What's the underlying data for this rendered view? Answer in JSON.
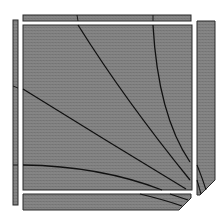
{
  "diagram": {
    "type": "geometric-illustration",
    "colors": {
      "fill": "#808080",
      "stroke": "#1a1a1a",
      "background": "#ffffff"
    },
    "panels": [
      {
        "name": "top-bar",
        "x": 23,
        "y": 15,
        "w": 168,
        "h": 6
      },
      {
        "name": "left-bar",
        "x": 13,
        "y": 20,
        "w": 5,
        "h": 185
      },
      {
        "name": "main-square",
        "x": 23,
        "y": 25,
        "w": 169,
        "h": 165
      },
      {
        "name": "right-bar",
        "x": 197,
        "y": 21,
        "w": 18,
        "h": 174
      },
      {
        "name": "bottom-bar",
        "x": 23,
        "y": 194,
        "w": 168,
        "h": 16
      }
    ],
    "curves": [
      {
        "name": "curve-1",
        "d": "M78,25 Q120,100 190,178"
      },
      {
        "name": "curve-2",
        "d": "M153,25 Q160,110 190,160"
      },
      {
        "name": "curve-3",
        "d": "M23,89 Q100,140 185,188"
      },
      {
        "name": "curve-4",
        "d": "M23,165 Q100,168 160,190"
      }
    ]
  }
}
